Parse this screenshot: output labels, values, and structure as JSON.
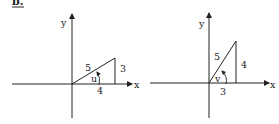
{
  "problem_label": "b.",
  "left_figure": {
    "axis_x_label": "x",
    "axis_y_label": "y",
    "hypotenuse": "5",
    "opposite": "3",
    "adjacent": "4",
    "angle": "u"
  },
  "right_figure": {
    "axis_x_label": "x",
    "axis_y_label": "y",
    "hypotenuse": "5",
    "opposite": "4",
    "adjacent": "3",
    "angle": "v"
  },
  "colors": {
    "ink": "#222222",
    "background": "#ffffff"
  }
}
